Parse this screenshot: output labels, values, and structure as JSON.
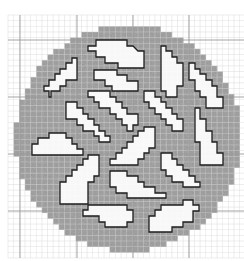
{
  "diagram": {
    "type": "wafer-die-map",
    "canvas": {
      "width": 244,
      "height": 261
    },
    "grid": {
      "x0": 8,
      "y0": 15,
      "x1": 244,
      "y1": 258,
      "minor_step": 5.65,
      "major_lines_x": [
        20,
        77,
        133,
        189
      ],
      "major_lines_y": [
        40,
        97,
        154,
        211
      ],
      "minor_color": "#d2d2d2",
      "major_color": "#9a9a9a"
    },
    "disc": {
      "cx": 128,
      "cy": 138,
      "r": 113,
      "fill": "#a9a9a9"
    },
    "region_style": {
      "fill": "#ffffff",
      "stroke": "#1e1e1e",
      "stroke_width": 1.3
    },
    "regions": [
      {
        "name": "region-top-center",
        "points": "88,46 96,46 96,40 127,40 127,46 133,46 138,51 144,51 144,68 118,68 118,63 105,63 105,57 96,57 96,51 88,51"
      },
      {
        "name": "region-top-left-diagonal",
        "points": "72,58 77,58 77,80 66,80 66,86 60,86 60,91 51,91 51,97 49,97 49,91 44,91 44,86 49,86 49,80 55,80 55,74 60,74 60,69 66,69 66,63 72,63"
      },
      {
        "name": "region-upper-mid",
        "points": "94,70 117,70 117,75 127,75 127,81 138,81 138,91 112,91 112,86 105,86 105,80 94,80"
      },
      {
        "name": "region-top-right-tall",
        "points": "161,46 166,46 166,51 172,51 172,57 177,57 177,63 183,63 183,86 177,86 177,97 166,97 166,91 161,91"
      },
      {
        "name": "region-far-right-diagonal",
        "points": "189,63 195,63 195,69 200,69 200,74 206,74 206,80 212,80 212,86 217,86 217,97 223,97 223,108 206,108 206,97 200,97 200,91 195,91 195,80 189,80"
      },
      {
        "name": "region-center-diagonal-1",
        "points": "88,91 110,91 110,97 116,97 116,102 122,102 122,108 127,108 127,114 138,114 138,125 133,125 133,131 127,131 127,125 122,125 122,119 116,119 116,114 110,114 110,108 99,108 99,102 94,102 94,97 88,97"
      },
      {
        "name": "region-center-right-diagonal",
        "points": "144,91 155,91 155,97 161,97 161,102 166,102 166,108 172,108 172,114 177,114 177,119 183,119 183,131 172,131 172,125 166,125 166,119 161,119 161,114 155,114 155,108 149,108 149,102 144,102"
      },
      {
        "name": "region-left-diagonal",
        "points": "66,102 77,102 77,108 83,108 83,114 88,114 88,119 94,119 94,125 99,125 99,131 105,131 105,136 110,136 110,142 99,142 99,136 94,136 94,131 83,131 83,125 77,125 77,119 66,119"
      },
      {
        "name": "region-right-tall",
        "points": "195,108 200,108 200,119 206,119 206,131 212,131 212,142 217,142 217,153 223,153 223,165 200,165 200,142 195,142"
      },
      {
        "name": "region-left-mound",
        "points": "32,144 38,144 38,138 49,138 49,133 66,133 66,138 72,138 72,144 77,144 77,149 83,149 83,155 32,155"
      },
      {
        "name": "region-center-diagonal-2",
        "points": "144,127 155,127 155,148 149,148 149,153 144,153 144,159 138,159 138,165 110,165 110,159 116,159 116,153 122,153 122,148 127,148 127,142 133,142 133,136 138,136 138,131 144,131"
      },
      {
        "name": "region-lower-left-tall",
        "points": "88,155 99,155 99,176 94,176 94,182 88,182 88,204 60,204 60,182 66,182 66,176 72,176 72,170 77,170 77,165 83,165 83,159 88,159"
      },
      {
        "name": "region-lower-right-diagonal",
        "points": "161,153 172,153 172,159 177,159 177,165 183,165 183,170 189,170 189,176 195,176 195,182 200,182 200,187 183,187 183,182 172,182 172,176 166,176 166,170 161,170"
      },
      {
        "name": "region-lower-center-mound",
        "points": "110,171 127,171 127,176 138,176 138,182 144,182 144,187 155,187 155,193 166,193 166,198 127,198 127,193 116,193 116,187 110,187"
      },
      {
        "name": "region-bottom-left-blob",
        "points": "88,205 127,205 127,210 133,210 133,222 127,222 127,227 105,227 105,222 99,222 99,216 83,216 83,210 88,210"
      },
      {
        "name": "region-bottom-right-blob",
        "points": "183,200 193,200 193,205 199,205 199,211 193,211 193,222 183,222 183,227 172,227 172,232 149,232 149,216 155,216 155,210 161,210 161,205 183,205"
      }
    ]
  }
}
